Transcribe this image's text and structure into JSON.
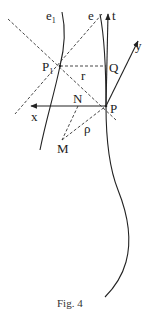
{
  "figure": {
    "caption": "Fig. 4",
    "labels": {
      "e1": "e",
      "e1_sub": "1",
      "e": "e",
      "t": "t",
      "y": "y",
      "P1": "P",
      "P1_sub": "1",
      "Q": "Q",
      "r": "r",
      "x": "x",
      "N": "N",
      "P": "P",
      "rho": "ρ",
      "M": "M"
    },
    "colors": {
      "ink": "#222222",
      "background": "#ffffff"
    }
  }
}
